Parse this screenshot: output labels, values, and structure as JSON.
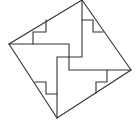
{
  "diagram": {
    "stroke_color": "#333333",
    "background_color": "#ffffff",
    "outer_square": [
      [
        82,
        0
      ],
      [
        131,
        70
      ],
      [
        57,
        118
      ],
      [
        9,
        44
      ]
    ],
    "dividers": [
      [
        [
          9,
          44
        ],
        [
          69,
          44
        ],
        [
          69,
          70
        ],
        [
          131,
          70
        ]
      ],
      [
        [
          82,
          0
        ],
        [
          82,
          57
        ],
        [
          57,
          57
        ],
        [
          57,
          118
        ]
      ]
    ],
    "notches": [
      [
        [
          46,
          20
        ],
        [
          46,
          32
        ],
        [
          33,
          32
        ],
        [
          33,
          44
        ]
      ],
      [
        [
          82,
          20
        ],
        [
          93,
          20
        ],
        [
          93,
          32
        ],
        [
          103,
          32
        ]
      ],
      [
        [
          35,
          82
        ],
        [
          46,
          82
        ],
        [
          46,
          94
        ],
        [
          57,
          94
        ]
      ],
      [
        [
          107,
          70
        ],
        [
          107,
          82
        ],
        [
          96,
          82
        ],
        [
          96,
          93
        ]
      ]
    ]
  }
}
